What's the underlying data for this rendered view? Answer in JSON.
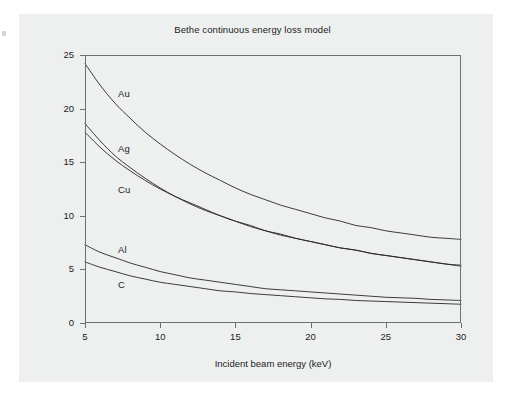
{
  "figure": {
    "title": "Bethe continuous energy loss model",
    "background_color": "#eef0ef",
    "frame_color": "#6d7270",
    "curve_color": "#262626"
  },
  "chart_data": {
    "type": "line",
    "title": "Bethe continuous energy loss model",
    "xlabel": "Incident beam energy (keV)",
    "ylabel": "Energy loss rate (eV/nm)",
    "xlim": [
      5,
      30
    ],
    "ylim": [
      0,
      25
    ],
    "xticks": [
      "5",
      "10",
      "15",
      "20",
      "25",
      "30"
    ],
    "yticks": [
      "0",
      "5",
      "10",
      "15",
      "20",
      "25"
    ],
    "xtick_values": [
      5,
      10,
      15,
      20,
      25,
      30
    ],
    "ytick_values": [
      0,
      5,
      10,
      15,
      20,
      25
    ],
    "grid": false,
    "legend": "inline annotations on curves",
    "x": [
      5,
      6,
      7,
      8,
      9,
      10,
      11,
      12,
      13,
      14,
      15,
      16,
      17,
      18,
      19,
      20,
      21,
      22,
      23,
      24,
      25,
      26,
      27,
      28,
      29,
      30
    ],
    "series": [
      {
        "name": "Au",
        "label": "Au",
        "values": [
          24.2,
          22.2,
          20.5,
          19.1,
          17.8,
          16.7,
          15.7,
          14.8,
          14.0,
          13.3,
          12.6,
          12.0,
          11.5,
          11.0,
          10.6,
          10.2,
          9.8,
          9.5,
          9.1,
          8.9,
          8.6,
          8.4,
          8.2,
          8.0,
          7.9,
          7.8
        ]
      },
      {
        "name": "Ag",
        "label": "Ag",
        "values": [
          18.6,
          17.0,
          15.6,
          14.5,
          13.5,
          12.6,
          11.8,
          11.2,
          10.6,
          10.0,
          9.5,
          9.1,
          8.6,
          8.3,
          7.9,
          7.6,
          7.3,
          7.0,
          6.8,
          6.5,
          6.3,
          6.1,
          5.9,
          5.7,
          5.5,
          5.4
        ]
      },
      {
        "name": "Cu",
        "label": "Cu",
        "values": [
          17.8,
          16.4,
          15.2,
          14.2,
          13.3,
          12.5,
          11.8,
          11.1,
          10.5,
          10.0,
          9.5,
          9.0,
          8.6,
          8.2,
          7.9,
          7.6,
          7.3,
          7.0,
          6.8,
          6.5,
          6.3,
          6.1,
          5.9,
          5.7,
          5.5,
          5.3
        ]
      },
      {
        "name": "Al",
        "label": "Al",
        "values": [
          7.3,
          6.6,
          6.1,
          5.6,
          5.2,
          4.8,
          4.5,
          4.2,
          4.0,
          3.8,
          3.6,
          3.4,
          3.2,
          3.1,
          3.0,
          2.9,
          2.8,
          2.7,
          2.6,
          2.5,
          2.4,
          2.35,
          2.3,
          2.2,
          2.15,
          2.1
        ]
      },
      {
        "name": "C",
        "label": "C",
        "values": [
          5.7,
          5.2,
          4.8,
          4.4,
          4.1,
          3.8,
          3.6,
          3.4,
          3.2,
          3.0,
          2.9,
          2.75,
          2.65,
          2.55,
          2.45,
          2.35,
          2.25,
          2.2,
          2.1,
          2.05,
          2.0,
          1.95,
          1.9,
          1.85,
          1.8,
          1.75
        ]
      }
    ],
    "annotations": [
      {
        "text": "Au",
        "x": 7.2,
        "y": 21.4
      },
      {
        "text": "Ag",
        "x": 7.2,
        "y": 16.2
      },
      {
        "text": "Cu",
        "x": 7.2,
        "y": 12.4
      },
      {
        "text": "Al",
        "x": 7.2,
        "y": 6.8
      },
      {
        "text": "C",
        "x": 7.2,
        "y": 3.5
      }
    ]
  }
}
